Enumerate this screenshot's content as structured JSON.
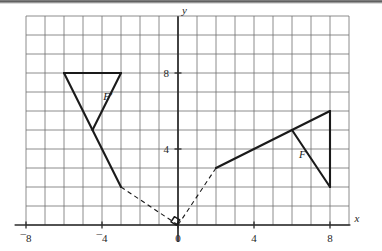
{
  "figure": {
    "background_color": "#ffffff",
    "ink_color": "#1a1a1a",
    "grid_color": "#6e6e6e",
    "axis_color": "#2b2b2b"
  },
  "axes": {
    "x_axis_label": "x",
    "y_axis_label": "y",
    "x_ticks": [
      {
        "value": -8,
        "label": "¯8"
      },
      {
        "value": -4,
        "label": "¯4"
      },
      {
        "value": 0,
        "label": "0"
      },
      {
        "value": 4,
        "label": "4"
      },
      {
        "value": 8,
        "label": "8"
      }
    ],
    "y_ticks": [
      {
        "value": 4,
        "label": "4"
      },
      {
        "value": 8,
        "label": "8"
      }
    ],
    "x_range": [
      -8.6,
      9.6
    ],
    "y_range": [
      -0.9,
      11.2
    ],
    "grid_step": 1,
    "grid_x_range": [
      -8,
      9
    ],
    "grid_y_range": [
      0,
      11
    ]
  },
  "chart_data": {
    "type": "scatter",
    "title": "",
    "xlabel": "x",
    "ylabel": "y",
    "grid": true,
    "legend": "none",
    "xlim": [
      -8.6,
      9.6
    ],
    "ylim": [
      -0.9,
      11.2
    ],
    "xticks": [
      -8,
      -4,
      0,
      4,
      8
    ],
    "yticks": [
      4,
      8
    ],
    "shapes": [
      {
        "name": "F",
        "label": "F",
        "label_position": {
          "x": 6.55,
          "y": 3.55
        },
        "style": "solid",
        "vertices": [
          {
            "x": 2,
            "y": 3
          },
          {
            "x": 8,
            "y": 6
          },
          {
            "x": 8,
            "y": 2
          }
        ],
        "edges": [
          {
            "from": {
              "x": 2,
              "y": 3
            },
            "to": {
              "x": 8,
              "y": 6
            }
          },
          {
            "from": {
              "x": 8,
              "y": 6
            },
            "to": {
              "x": 8,
              "y": 2
            }
          },
          {
            "from": {
              "x": 6,
              "y": 5
            },
            "to": {
              "x": 8,
              "y": 2
            }
          }
        ]
      },
      {
        "name": "F-prime",
        "label": "F′",
        "label_position": {
          "x": -3.7,
          "y": 6.6
        },
        "style": "solid",
        "vertices": [
          {
            "x": -6,
            "y": 8
          },
          {
            "x": -3,
            "y": 8
          },
          {
            "x": -3,
            "y": 2
          }
        ],
        "edges": [
          {
            "from": {
              "x": -6,
              "y": 8
            },
            "to": {
              "x": -3,
              "y": 8
            }
          },
          {
            "from": {
              "x": -6,
              "y": 8
            },
            "to": {
              "x": -3,
              "y": 2
            }
          },
          {
            "from": {
              "x": -3,
              "y": 8
            },
            "to": {
              "x": -4.5,
              "y": 5
            }
          }
        ]
      }
    ],
    "connectors": [
      {
        "name": "connector-f-prime-to-origin",
        "style": "dashed",
        "from": {
          "x": -3,
          "y": 2
        },
        "to": {
          "x": 0,
          "y": 0
        }
      },
      {
        "name": "connector-origin-to-f",
        "style": "dashed",
        "from": {
          "x": 0,
          "y": 0
        },
        "to": {
          "x": 2,
          "y": 3
        }
      }
    ],
    "annotations": [
      {
        "name": "right-angle-marker",
        "kind": "right-angle",
        "at": {
          "x": 0,
          "y": 0
        },
        "description": "small square marking the right angle between the two dashed segments at the origin"
      }
    ]
  }
}
